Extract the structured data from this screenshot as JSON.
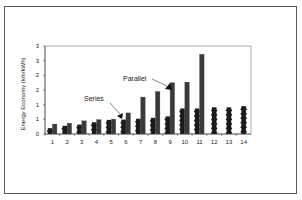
{
  "chart_data": {
    "type": "bar",
    "title": "",
    "xlabel": "",
    "ylabel": "Energy Economy (km/kWh)",
    "ylim": [
      0,
      3
    ],
    "ytick_labels": [
      "0",
      "1",
      "1",
      "2",
      "2",
      "3",
      "3"
    ],
    "ytick_values": [
      0,
      0.5,
      1.0,
      1.5,
      2.0,
      2.5,
      3.0
    ],
    "grid": false,
    "legend": null,
    "categories": [
      "1",
      "2",
      "3",
      "4",
      "5",
      "6",
      "7",
      "8",
      "9",
      "10",
      "11",
      "12",
      "13",
      "14"
    ],
    "series": [
      {
        "name": "Series",
        "color": "#1a1a1a",
        "values": [
          0.2,
          0.28,
          0.32,
          0.4,
          0.48,
          0.49,
          0.52,
          0.55,
          0.6,
          0.87,
          0.87,
          0.91,
          0.91,
          0.95
        ]
      },
      {
        "name": "Parallel",
        "color": "#3a3a3a",
        "values": [
          0.34,
          0.37,
          0.45,
          0.49,
          0.51,
          0.72,
          1.26,
          1.45,
          1.75,
          1.77,
          2.72,
          null,
          null,
          null
        ]
      }
    ],
    "annotations": [
      {
        "text": "Series",
        "points_to_category": "6",
        "points_to_series": "Series"
      },
      {
        "text": "Parallel",
        "points_to_category": "9",
        "points_to_series": "Parallel"
      }
    ]
  }
}
